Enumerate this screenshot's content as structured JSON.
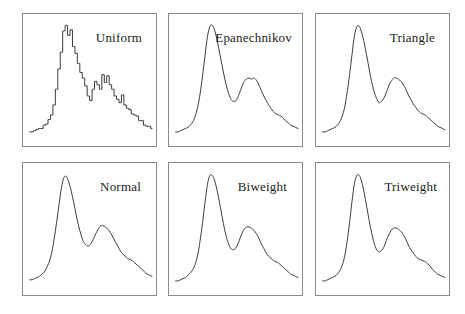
{
  "figure": {
    "width": 465,
    "height": 314,
    "background": "#ffffff",
    "panel_border_color": "#8a8a8a",
    "curve_color": "#3b3b3b",
    "label_color": "#1c1c1c"
  },
  "chart_data": {
    "type": "line",
    "title": "",
    "subtitle": "",
    "xlabel": "",
    "ylabel": "",
    "grid": false,
    "legend": "none",
    "axis_ticks": "none",
    "layout": {
      "rows": 2,
      "cols": 3,
      "order": "row-major"
    },
    "xlim": [
      0,
      1
    ],
    "ylim": [
      0,
      1
    ],
    "x": [
      0.0,
      0.02,
      0.04,
      0.06,
      0.08,
      0.1,
      0.12,
      0.14,
      0.16,
      0.18,
      0.2,
      0.22,
      0.24,
      0.26,
      0.28,
      0.3,
      0.32,
      0.34,
      0.36,
      0.38,
      0.4,
      0.42,
      0.44,
      0.46,
      0.48,
      0.5,
      0.52,
      0.54,
      0.56,
      0.58,
      0.6,
      0.62,
      0.64,
      0.66,
      0.68,
      0.7,
      0.72,
      0.74,
      0.76,
      0.78,
      0.8,
      0.82,
      0.84,
      0.86,
      0.88,
      0.9,
      0.92,
      0.94,
      0.96,
      0.98,
      1.0
    ],
    "panels": [
      {
        "id": "uniform",
        "label": "Uniform",
        "row": 0,
        "col": 0,
        "smoothness": "jagged, piecewise-constant steps",
        "peaks": [
          {
            "x": 0.25,
            "y": 0.97
          },
          {
            "x": 0.6,
            "y": 0.53
          }
        ],
        "valley": {
          "x": 0.47,
          "y": 0.3
        },
        "values": [
          0.02,
          0.02,
          0.03,
          0.04,
          0.05,
          0.05,
          0.08,
          0.09,
          0.13,
          0.17,
          0.26,
          0.4,
          0.58,
          0.73,
          0.92,
          0.97,
          0.88,
          0.93,
          0.78,
          0.72,
          0.63,
          0.55,
          0.5,
          0.43,
          0.34,
          0.3,
          0.4,
          0.47,
          0.44,
          0.4,
          0.53,
          0.46,
          0.52,
          0.44,
          0.4,
          0.34,
          0.31,
          0.28,
          0.35,
          0.26,
          0.23,
          0.22,
          0.18,
          0.17,
          0.16,
          0.12,
          0.12,
          0.08,
          0.07,
          0.07,
          0.05
        ]
      },
      {
        "id": "epanechnikov",
        "label": "Epanechnikov",
        "row": 0,
        "col": 1,
        "smoothness": "smooth with a small shoulder on the second mode",
        "peaks": [
          {
            "x": 0.26,
            "y": 0.97
          },
          {
            "x": 0.6,
            "y": 0.5
          }
        ],
        "valley": {
          "x": 0.45,
          "y": 0.29
        },
        "values": [
          0.02,
          0.02,
          0.03,
          0.04,
          0.05,
          0.06,
          0.08,
          0.11,
          0.16,
          0.24,
          0.36,
          0.52,
          0.7,
          0.87,
          0.96,
          0.97,
          0.92,
          0.83,
          0.72,
          0.61,
          0.5,
          0.41,
          0.34,
          0.3,
          0.29,
          0.31,
          0.36,
          0.42,
          0.47,
          0.49,
          0.5,
          0.49,
          0.5,
          0.48,
          0.44,
          0.39,
          0.34,
          0.3,
          0.26,
          0.23,
          0.2,
          0.18,
          0.17,
          0.16,
          0.14,
          0.12,
          0.1,
          0.08,
          0.07,
          0.06,
          0.05
        ]
      },
      {
        "id": "triangle",
        "label": "Triangle",
        "row": 0,
        "col": 2,
        "smoothness": "smooth",
        "peaks": [
          {
            "x": 0.26,
            "y": 0.97
          },
          {
            "x": 0.6,
            "y": 0.5
          }
        ],
        "valley": {
          "x": 0.45,
          "y": 0.28
        },
        "values": [
          0.02,
          0.02,
          0.03,
          0.04,
          0.05,
          0.06,
          0.08,
          0.11,
          0.16,
          0.24,
          0.37,
          0.53,
          0.71,
          0.88,
          0.96,
          0.96,
          0.9,
          0.81,
          0.7,
          0.58,
          0.47,
          0.38,
          0.32,
          0.28,
          0.29,
          0.32,
          0.37,
          0.43,
          0.47,
          0.5,
          0.5,
          0.49,
          0.47,
          0.44,
          0.4,
          0.35,
          0.31,
          0.27,
          0.24,
          0.21,
          0.19,
          0.18,
          0.17,
          0.15,
          0.13,
          0.11,
          0.09,
          0.07,
          0.06,
          0.05,
          0.04
        ]
      },
      {
        "id": "normal",
        "label": "Normal",
        "row": 1,
        "col": 0,
        "smoothness": "smoothest, broadest, longest right tail",
        "peaks": [
          {
            "x": 0.26,
            "y": 0.95
          },
          {
            "x": 0.58,
            "y": 0.51
          }
        ],
        "valley": {
          "x": 0.45,
          "y": 0.33
        },
        "values": [
          0.03,
          0.03,
          0.04,
          0.05,
          0.06,
          0.08,
          0.1,
          0.14,
          0.19,
          0.27,
          0.39,
          0.54,
          0.7,
          0.85,
          0.94,
          0.95,
          0.9,
          0.82,
          0.72,
          0.61,
          0.51,
          0.43,
          0.37,
          0.34,
          0.33,
          0.35,
          0.39,
          0.44,
          0.48,
          0.51,
          0.51,
          0.5,
          0.48,
          0.45,
          0.41,
          0.37,
          0.33,
          0.29,
          0.26,
          0.24,
          0.22,
          0.21,
          0.2,
          0.18,
          0.16,
          0.14,
          0.12,
          0.1,
          0.08,
          0.07,
          0.06
        ]
      },
      {
        "id": "biweight",
        "label": "Biweight",
        "row": 1,
        "col": 1,
        "smoothness": "smooth",
        "peaks": [
          {
            "x": 0.26,
            "y": 0.96
          },
          {
            "x": 0.59,
            "y": 0.5
          }
        ],
        "valley": {
          "x": 0.45,
          "y": 0.3
        },
        "values": [
          0.02,
          0.02,
          0.03,
          0.04,
          0.05,
          0.07,
          0.09,
          0.12,
          0.17,
          0.25,
          0.38,
          0.54,
          0.72,
          0.88,
          0.96,
          0.96,
          0.91,
          0.82,
          0.71,
          0.59,
          0.48,
          0.39,
          0.33,
          0.3,
          0.3,
          0.33,
          0.38,
          0.44,
          0.48,
          0.5,
          0.5,
          0.49,
          0.47,
          0.44,
          0.4,
          0.35,
          0.31,
          0.27,
          0.24,
          0.22,
          0.2,
          0.19,
          0.18,
          0.16,
          0.14,
          0.12,
          0.1,
          0.08,
          0.07,
          0.06,
          0.05
        ]
      },
      {
        "id": "triweight",
        "label": "Triweight",
        "row": 1,
        "col": 2,
        "smoothness": "smooth, slightly narrower modes",
        "peaks": [
          {
            "x": 0.26,
            "y": 0.96
          },
          {
            "x": 0.59,
            "y": 0.49
          }
        ],
        "valley": {
          "x": 0.45,
          "y": 0.28
        },
        "values": [
          0.02,
          0.02,
          0.03,
          0.04,
          0.05,
          0.06,
          0.08,
          0.11,
          0.16,
          0.24,
          0.37,
          0.54,
          0.73,
          0.89,
          0.96,
          0.96,
          0.9,
          0.8,
          0.68,
          0.56,
          0.45,
          0.36,
          0.3,
          0.28,
          0.29,
          0.32,
          0.38,
          0.43,
          0.47,
          0.49,
          0.49,
          0.48,
          0.46,
          0.43,
          0.39,
          0.34,
          0.3,
          0.27,
          0.24,
          0.22,
          0.21,
          0.2,
          0.19,
          0.17,
          0.15,
          0.12,
          0.1,
          0.08,
          0.07,
          0.06,
          0.05
        ]
      }
    ]
  }
}
